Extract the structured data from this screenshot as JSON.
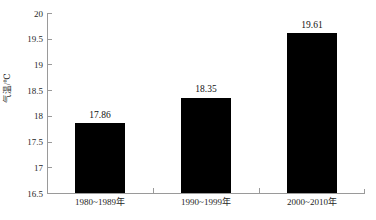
{
  "chart_data": {
    "type": "bar",
    "title": "",
    "xlabel": "",
    "ylabel": "气温/℃",
    "categories": [
      "1980~1989年",
      "1990~1999年",
      "2000~2010年"
    ],
    "values": [
      17.86,
      18.35,
      19.61
    ],
    "value_labels": [
      "17.86",
      "18.35",
      "19.61"
    ],
    "ylim": [
      16.5,
      20
    ],
    "ytick_labels": [
      "20",
      "19.5",
      "19",
      "18.5",
      "18",
      "17.5",
      "17",
      "16.5"
    ],
    "ytick_values": [
      20,
      19.5,
      19,
      18.5,
      18,
      17.5,
      17,
      16.5
    ],
    "grid": false,
    "legend": "none",
    "bar_color": "#000000",
    "axis_color": "#9a9a9a",
    "background_color": "#ffffff"
  }
}
